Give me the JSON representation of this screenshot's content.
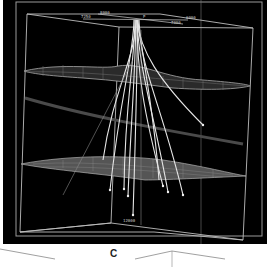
{
  "figure": {
    "panel_label": "C",
    "background": "#000000",
    "line_color": "#d8d8d8",
    "surface_color": "#9a9a9a"
  },
  "viewport": {
    "top_labels": [
      "7250",
      "8000",
      "P",
      "6000",
      "7000"
    ],
    "depth_label": "12000",
    "surfaces": [
      "upper-horizon-mesh",
      "middle-horizon-band",
      "lower-horizon-mesh"
    ],
    "well_count": 12
  }
}
